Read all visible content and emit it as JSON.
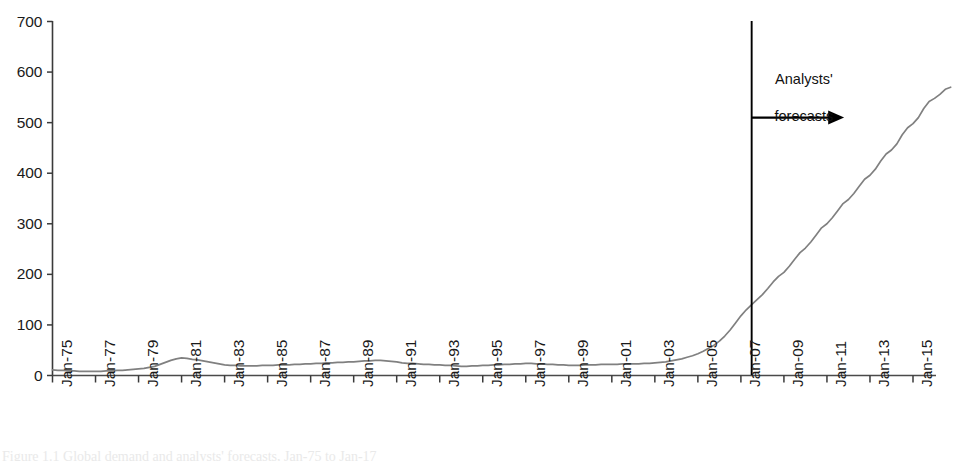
{
  "chart_data": {
    "type": "line",
    "title": "",
    "subtitle": "",
    "xlabel": "",
    "ylabel": "",
    "ylim": [
      0,
      700
    ],
    "yticks": [
      0,
      100,
      200,
      300,
      400,
      500,
      600,
      700
    ],
    "ytick_labels": [
      "0",
      "100",
      "200",
      "300",
      "400",
      "500",
      "600",
      "700"
    ],
    "grid": false,
    "legend": "none",
    "xlim": [
      "Jan-75",
      "Jan-17"
    ],
    "xtick_labels": [
      "Jan-75",
      "Jan-77",
      "Jan-79",
      "Jan-81",
      "Jan-83",
      "Jan-85",
      "Jan-87",
      "Jan-89",
      "Jan-91",
      "Jan-93",
      "Jan-95",
      "Jan-97",
      "Jan-99",
      "Jan-01",
      "Jan-03",
      "Jan-05",
      "Jan-07",
      "Jan-09",
      "Jan-11",
      "Jan-13",
      "Jan-15"
    ],
    "series": [
      {
        "name": "value",
        "color": "#808080",
        "x": [
          1975.0,
          1975.25,
          1975.5,
          1975.75,
          1976.0,
          1976.25,
          1976.5,
          1976.75,
          1977.0,
          1977.25,
          1977.5,
          1977.75,
          1978.0,
          1978.25,
          1978.5,
          1978.75,
          1979.0,
          1979.25,
          1979.5,
          1979.75,
          1980.0,
          1980.25,
          1980.5,
          1980.75,
          1981.0,
          1981.25,
          1981.5,
          1981.75,
          1982.0,
          1982.25,
          1982.5,
          1982.75,
          1983.0,
          1983.25,
          1983.5,
          1983.75,
          1984.0,
          1984.25,
          1984.5,
          1984.75,
          1985.0,
          1985.25,
          1985.5,
          1985.75,
          1986.0,
          1986.25,
          1986.5,
          1986.75,
          1987.0,
          1987.25,
          1987.5,
          1987.75,
          1988.0,
          1988.25,
          1988.5,
          1988.75,
          1989.0,
          1989.25,
          1989.5,
          1989.75,
          1990.0,
          1990.25,
          1990.5,
          1990.75,
          1991.0,
          1991.25,
          1991.5,
          1991.75,
          1992.0,
          1992.25,
          1992.5,
          1992.75,
          1993.0,
          1993.25,
          1993.5,
          1993.75,
          1994.0,
          1994.25,
          1994.5,
          1994.75,
          1995.0,
          1995.25,
          1995.5,
          1995.75,
          1996.0,
          1996.25,
          1996.5,
          1996.75,
          1997.0,
          1997.25,
          1997.5,
          1997.75,
          1998.0,
          1998.25,
          1998.5,
          1998.75,
          1999.0,
          1999.25,
          1999.5,
          1999.75,
          2000.0,
          2000.25,
          2000.5,
          2000.75,
          2001.0,
          2001.25,
          2001.5,
          2001.75,
          2002.0,
          2002.25,
          2002.5,
          2002.75,
          2003.0,
          2003.25,
          2003.5,
          2003.75,
          2004.0,
          2004.25,
          2004.5,
          2004.75,
          2005.0,
          2005.25,
          2005.5,
          2005.75,
          2006.0,
          2006.25,
          2006.5,
          2006.75,
          2007.0,
          2007.25,
          2007.5,
          2007.75,
          2008.0,
          2008.25,
          2008.5,
          2008.75,
          2009.0,
          2009.25,
          2009.5,
          2009.75,
          2010.0,
          2010.25,
          2010.5,
          2010.75,
          2011.0,
          2011.25,
          2011.5,
          2011.75,
          2012.0,
          2012.25,
          2012.5,
          2012.75,
          2013.0,
          2013.25,
          2013.5,
          2013.75,
          2014.0,
          2014.25,
          2014.5,
          2014.75,
          2015.0,
          2015.25,
          2015.5,
          2015.75,
          2016.0,
          2016.25,
          2016.5,
          2016.75
        ],
        "y": [
          11,
          10,
          10,
          9,
          9,
          8,
          8,
          8,
          8,
          8,
          9,
          9,
          10,
          10,
          11,
          12,
          13,
          14,
          16,
          18,
          22,
          26,
          30,
          33,
          35,
          34,
          32,
          31,
          29,
          27,
          25,
          23,
          21,
          20,
          20,
          19,
          19,
          19,
          19,
          20,
          20,
          20,
          21,
          21,
          21,
          22,
          22,
          23,
          23,
          24,
          24,
          25,
          25,
          26,
          26,
          27,
          27,
          28,
          29,
          29,
          30,
          30,
          29,
          28,
          27,
          25,
          24,
          24,
          23,
          22,
          22,
          21,
          21,
          20,
          20,
          19,
          18,
          18,
          19,
          19,
          20,
          20,
          21,
          21,
          22,
          22,
          23,
          23,
          24,
          24,
          23,
          23,
          22,
          22,
          21,
          21,
          20,
          20,
          20,
          21,
          21,
          21,
          22,
          22,
          22,
          22,
          23,
          23,
          23,
          23,
          24,
          24,
          25,
          26,
          27,
          29,
          31,
          33,
          36,
          39,
          43,
          48,
          54,
          60,
          68,
          78,
          90,
          104,
          118,
          130,
          140,
          150,
          160,
          172,
          185,
          196,
          204,
          216,
          230,
          243,
          252,
          264,
          278,
          292,
          300,
          312,
          326,
          340,
          348,
          360,
          374,
          388,
          396,
          408,
          424,
          438,
          446,
          458,
          476,
          490,
          498,
          510,
          528,
          542,
          548,
          556,
          566,
          570
        ]
      }
    ],
    "annotations": [
      {
        "name": "forecast-divider",
        "type": "vline",
        "x": 2007.5,
        "color": "#000000"
      },
      {
        "name": "forecast-arrow",
        "type": "arrow",
        "from_x": 2007.5,
        "to_x": 2011.8,
        "y": 510,
        "color": "#000000"
      },
      {
        "name": "forecast-label",
        "type": "text",
        "lines": [
          "Analysts'",
          "forecasts"
        ],
        "color": "#111111"
      }
    ]
  },
  "annotation": {
    "line1": "Analysts'",
    "line2": "forecasts"
  },
  "caption": {
    "text": "Figure 1.1  Global demand and analysts' forecasts, Jan-75 to Jan-17"
  }
}
